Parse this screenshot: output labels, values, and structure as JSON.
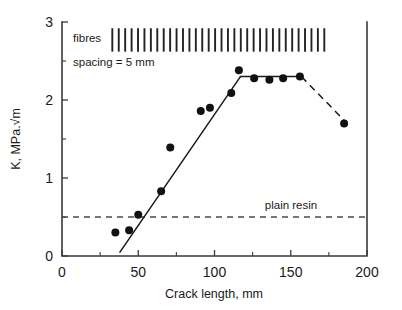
{
  "chart_data": {
    "type": "scatter",
    "title": "",
    "xlabel": "Crack length, mm",
    "ylabel": "K, MPa.√m",
    "xlim": [
      0,
      200
    ],
    "ylim": [
      0,
      3
    ],
    "xticks": [
      0,
      50,
      100,
      150,
      200
    ],
    "xticklabels": [
      "0",
      "50",
      "100",
      "150",
      "200"
    ],
    "yticks": [
      0,
      1,
      2,
      3
    ],
    "yticklabels": [
      "0",
      "1",
      "2",
      "3"
    ],
    "y_minor_ticks": [
      0.5,
      1.5,
      2.5
    ],
    "grid": false,
    "legend": "none",
    "series": [
      {
        "name": "measured K",
        "style": "points",
        "x": [
          35,
          44,
          50,
          65,
          71,
          91,
          97,
          111,
          116,
          126,
          136,
          145,
          156,
          185
        ],
        "y": [
          0.3,
          0.33,
          0.53,
          0.83,
          1.39,
          1.86,
          1.9,
          2.09,
          2.38,
          2.28,
          2.26,
          2.28,
          2.3,
          1.7
        ]
      },
      {
        "name": "rising fit",
        "style": "solid-line",
        "x": [
          38,
          117
        ],
        "y": [
          0.05,
          2.3
        ]
      },
      {
        "name": "plateau",
        "style": "solid-line",
        "x": [
          117,
          157
        ],
        "y": [
          2.3,
          2.3
        ]
      },
      {
        "name": "decline",
        "style": "dashed-line",
        "x": [
          157,
          187
        ],
        "y": [
          2.3,
          1.7
        ]
      },
      {
        "name": "plain resin",
        "style": "dashed-reference",
        "x": [
          0,
          200
        ],
        "y": [
          0.5,
          0.5
        ]
      }
    ],
    "annotations": [
      {
        "name": "fibres",
        "text": "fibres",
        "x": 18,
        "y": 2.77
      },
      {
        "name": "spacing",
        "text": "spacing = 5 mm",
        "x": 18,
        "y": 2.52
      },
      {
        "name": "plain-resin",
        "text": "plain resin",
        "x": 150,
        "y": 0.62
      }
    ],
    "fibre_marks": {
      "label": "fibres",
      "spacing_mm": 5,
      "count": 34,
      "x_start": 33,
      "x_end": 172,
      "y_top": 2.92,
      "y_bottom": 2.62
    }
  },
  "colors": {
    "marker": "#111111",
    "line": "#1a1a1a",
    "reference": "#4a4a4a",
    "axis": "#3a3a3a",
    "background": "#ffffff"
  }
}
